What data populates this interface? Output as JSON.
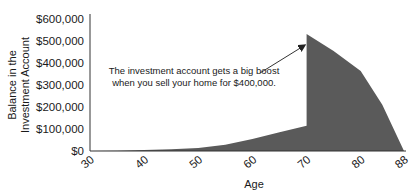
{
  "chart_data": {
    "type": "area",
    "title": "",
    "xlabel": "Age",
    "ylabel_lines": [
      "Balance in the",
      "Investment Account"
    ],
    "xlim": [
      30,
      88
    ],
    "ylim": [
      0,
      600000
    ],
    "x_ticks": [
      30,
      40,
      50,
      60,
      70,
      80,
      88
    ],
    "x_tick_labels": [
      "30",
      "40",
      "50",
      "60",
      "70",
      "80",
      "88"
    ],
    "y_ticks": [
      0,
      100000,
      200000,
      300000,
      400000,
      500000,
      600000
    ],
    "y_tick_labels": [
      "$0",
      "$100,000",
      "$200,000",
      "$300,000",
      "$400,000",
      "$500,000",
      "$600,000"
    ],
    "grid": false,
    "fill_color": "#5a5a5a",
    "series": [
      {
        "name": "Balance",
        "points": [
          [
            30,
            0
          ],
          [
            35,
            1500
          ],
          [
            40,
            4000
          ],
          [
            45,
            8000
          ],
          [
            50,
            14000
          ],
          [
            55,
            28000
          ],
          [
            60,
            55000
          ],
          [
            65,
            85000
          ],
          [
            70,
            115000
          ],
          [
            70,
            532000
          ],
          [
            75,
            455000
          ],
          [
            80,
            364000
          ],
          [
            84,
            210000
          ],
          [
            88,
            0
          ]
        ]
      }
    ],
    "annotation": {
      "lines": [
        "The investment account gets a big boost",
        "when you sell your home for $400,000."
      ],
      "arrow_target": [
        70,
        480000
      ]
    }
  }
}
